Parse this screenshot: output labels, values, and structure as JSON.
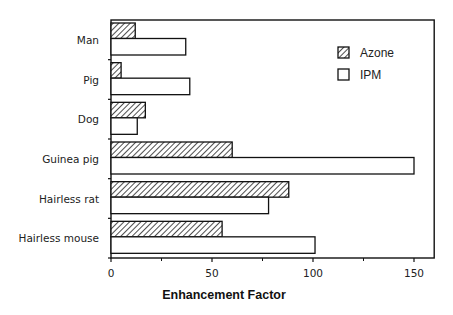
{
  "chart_data": {
    "type": "bar",
    "orientation": "horizontal",
    "title": "",
    "xlabel": "Enhancement Factor",
    "ylabel": "",
    "xlim": [
      0,
      160
    ],
    "xticks": [
      0,
      50,
      100,
      150
    ],
    "xticks_minor": [
      25,
      75,
      125
    ],
    "grid": false,
    "legend_position": "upper right",
    "categories": [
      "Man",
      "Pig",
      "Dog",
      "Guinea pig",
      "Hairless rat",
      "Hairless mouse"
    ],
    "series": [
      {
        "name": "Azone",
        "pattern": "hatched",
        "values": [
          12,
          5,
          17,
          60,
          88,
          55
        ]
      },
      {
        "name": "IPM",
        "pattern": "open",
        "values": [
          37,
          39,
          13,
          150,
          78,
          101
        ]
      }
    ]
  },
  "legend": {
    "items": [
      "Azone",
      "IPM"
    ]
  },
  "axis": {
    "xlabel": "Enhancement Factor",
    "tick_labels": [
      "0",
      "50",
      "100",
      "150"
    ]
  },
  "colors": {
    "stroke": "#111111",
    "background": "#ffffff"
  }
}
